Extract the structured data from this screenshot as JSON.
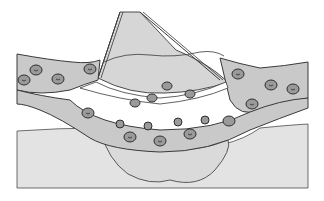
{
  "illustration": {
    "subject": "blood vessel with blood cells and tissue pocket",
    "style": "grayscale line drawing",
    "colors": {
      "background": "#ffffff",
      "tissue": "#e3e3e3",
      "vessel": "#c9c9c9",
      "pocket": "#d6d6d6",
      "cell_fill": "#9a9a9a",
      "outline": "#3a3a3a"
    },
    "cells": [
      {
        "x": 24,
        "y": 80
      },
      {
        "x": 58,
        "y": 79
      },
      {
        "x": 90,
        "y": 69
      },
      {
        "x": 36,
        "y": 70
      },
      {
        "x": 238,
        "y": 74
      },
      {
        "x": 271,
        "y": 85
      },
      {
        "x": 293,
        "y": 89
      },
      {
        "x": 88,
        "y": 113
      },
      {
        "x": 130,
        "y": 137
      },
      {
        "x": 160,
        "y": 141
      },
      {
        "x": 190,
        "y": 134
      },
      {
        "x": 252,
        "y": 104
      },
      {
        "x": 229,
        "y": 121
      },
      {
        "x": 167,
        "y": 86
      },
      {
        "x": 190,
        "y": 94
      },
      {
        "x": 152,
        "y": 98
      },
      {
        "x": 135,
        "y": 103
      }
    ]
  }
}
